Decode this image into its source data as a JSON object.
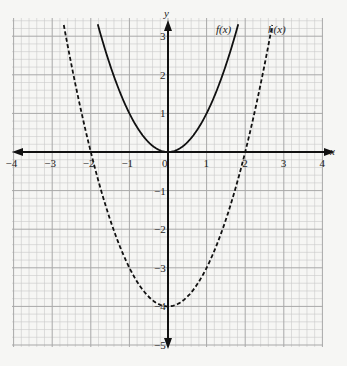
{
  "chart_data": {
    "type": "line",
    "title": "",
    "xlabel": "x",
    "ylabel": "y",
    "xlim": [
      -4,
      4
    ],
    "ylim": [
      -5,
      3.4
    ],
    "grid": true,
    "grid_minor_per_unit": 5,
    "x_ticks": [
      "-4",
      "-3",
      "-2",
      "-1",
      "0",
      "1",
      "2",
      "3",
      "4"
    ],
    "y_ticks": [
      "3",
      "2",
      "1",
      "-1",
      "-2",
      "-3",
      "-4",
      "-5"
    ],
    "series": [
      {
        "name": "f(x)",
        "style": "solid",
        "formula": "x^2",
        "points": [
          [
            -1.8,
            3.24
          ],
          [
            -1.5,
            2.25
          ],
          [
            -1,
            1
          ],
          [
            -0.5,
            0.25
          ],
          [
            0,
            0
          ],
          [
            0.5,
            0.25
          ],
          [
            1,
            1
          ],
          [
            1.5,
            2.25
          ],
          [
            1.8,
            3.24
          ]
        ]
      },
      {
        "name": "h(x)",
        "style": "dashed",
        "formula": "x^2 - 4",
        "points": [
          [
            -2.7,
            3.29
          ],
          [
            -2,
            0
          ],
          [
            -1,
            -3
          ],
          [
            0,
            -4
          ],
          [
            1,
            -3
          ],
          [
            2,
            0
          ],
          [
            2.7,
            3.29
          ]
        ]
      }
    ],
    "annotations": [
      {
        "text": "f(x)",
        "near": [
          1.3,
          3.1
        ]
      },
      {
        "text": "h(x)",
        "near": [
          2.75,
          3.1
        ]
      }
    ]
  },
  "labels": {
    "x_axis": "x",
    "y_axis": "y",
    "f_label": "f(x)",
    "h_label": "h(x)"
  }
}
